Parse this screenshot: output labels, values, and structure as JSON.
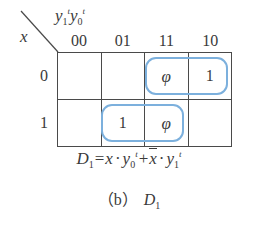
{
  "figure": {
    "axis_header": {
      "column_variables_text": "y1t y0t",
      "column_var_1_base": "y",
      "column_var_1_sub": "1",
      "column_var_1_sup": "t",
      "column_var_0_base": "y",
      "column_var_0_sub": "0",
      "column_var_0_sup": "t",
      "row_variable": "x"
    },
    "column_labels": [
      "00",
      "01",
      "11",
      "10"
    ],
    "row_labels": [
      "0",
      "1"
    ],
    "cells": [
      [
        {
          "value": "",
          "row": "0",
          "col": "00"
        },
        {
          "value": "",
          "row": "0",
          "col": "01"
        },
        {
          "value": "φ",
          "row": "0",
          "col": "11"
        },
        {
          "value": "1",
          "row": "0",
          "col": "10"
        }
      ],
      [
        {
          "value": "",
          "row": "1",
          "col": "00"
        },
        {
          "value": "1",
          "row": "1",
          "col": "01"
        },
        {
          "value": "φ",
          "row": "1",
          "col": "11"
        },
        {
          "value": "",
          "row": "1",
          "col": "10"
        }
      ]
    ],
    "groups": [
      {
        "name": "group-row0-cols-11-10",
        "cells": [
          "0-11",
          "0-10"
        ],
        "color": "#7cb0dd"
      },
      {
        "name": "group-row1-cols-01-11",
        "cells": [
          "1-01",
          "1-11"
        ],
        "color": "#7cb0dd"
      }
    ],
    "equation": {
      "lhs_base": "D",
      "lhs_sub": "1",
      "equals": "=",
      "term1_var": "x",
      "dot": "·",
      "term1_factor_base": "y",
      "term1_factor_sub": "0",
      "term1_factor_sup": "t",
      "plus": "+",
      "term2_var": "x",
      "term2_factor_base": "y",
      "term2_factor_sub": "1",
      "term2_factor_sup": "t",
      "full_text": "D1 = x · y0t + x̄ · y1t"
    },
    "caption": {
      "label": "（b）",
      "symbol_base": "D",
      "symbol_sub": "1"
    },
    "colors": {
      "grid_line": "#4a4a4a",
      "group_outline": "#7cb0dd",
      "text": "#3a3a3a",
      "background": "#ffffff"
    }
  }
}
